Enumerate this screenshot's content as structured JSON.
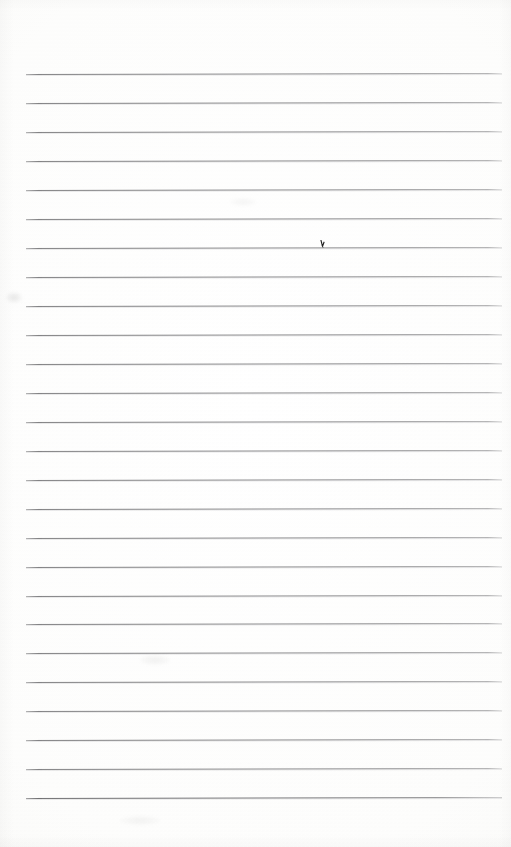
{
  "document": {
    "kind": "scanned-ruled-notebook-page",
    "title": "Blank Ruled Page",
    "orientation": "portrait",
    "page_width_px": 511,
    "page_height_px": 847,
    "body_text": "",
    "has_typed_text": false,
    "has_handwriting": false
  },
  "paper": {
    "background_color": "#ffffff",
    "tone_color": "#fdfdfc",
    "edge_shade_color": "#f5f5f3",
    "texture": "faint-scan-banding"
  },
  "ruling": {
    "line_color": "#86868a",
    "line_color_light": "#a9a9ac",
    "line_color_heavy": "#727275",
    "line_thickness_px": 1,
    "line_count": 26,
    "left_margin_px": 26,
    "right_margin_px": 502,
    "line_length_px": 476,
    "first_line_y_px": 74,
    "last_line_y_px": 798,
    "line_spacing_px": 29,
    "scan_skew_deg": -0.12,
    "top_margin_px": 74,
    "bottom_margin_px": 49,
    "lines": [
      {
        "index": 1,
        "y": 74,
        "weight": "normal"
      },
      {
        "index": 2,
        "y": 103,
        "weight": "normal"
      },
      {
        "index": 3,
        "y": 132,
        "weight": "normal"
      },
      {
        "index": 4,
        "y": 161,
        "weight": "normal"
      },
      {
        "index": 5,
        "y": 190,
        "weight": "normal"
      },
      {
        "index": 6,
        "y": 219,
        "weight": "normal"
      },
      {
        "index": 7,
        "y": 248,
        "weight": "normal"
      },
      {
        "index": 8,
        "y": 277,
        "weight": "normal"
      },
      {
        "index": 9,
        "y": 306,
        "weight": "normal"
      },
      {
        "index": 10,
        "y": 335,
        "weight": "normal"
      },
      {
        "index": 11,
        "y": 364,
        "weight": "normal"
      },
      {
        "index": 12,
        "y": 393,
        "weight": "normal"
      },
      {
        "index": 13,
        "y": 422,
        "weight": "normal"
      },
      {
        "index": 14,
        "y": 451,
        "weight": "normal"
      },
      {
        "index": 15,
        "y": 480,
        "weight": "normal"
      },
      {
        "index": 16,
        "y": 509,
        "weight": "normal"
      },
      {
        "index": 17,
        "y": 538,
        "weight": "normal"
      },
      {
        "index": 18,
        "y": 567,
        "weight": "normal"
      },
      {
        "index": 19,
        "y": 596,
        "weight": "normal"
      },
      {
        "index": 20,
        "y": 624,
        "weight": "normal"
      },
      {
        "index": 21,
        "y": 653,
        "weight": "normal"
      },
      {
        "index": 22,
        "y": 682,
        "weight": "normal"
      },
      {
        "index": 23,
        "y": 711,
        "weight": "normal"
      },
      {
        "index": 24,
        "y": 740,
        "weight": "normal"
      },
      {
        "index": 25,
        "y": 769,
        "weight": "normal"
      },
      {
        "index": 26,
        "y": 798,
        "weight": "heavy"
      }
    ]
  },
  "marks": {
    "pen_tick": {
      "label": "pen-tick-mark",
      "x": 320,
      "y": 240,
      "width": 5,
      "height": 8,
      "color": "#1f1f1f",
      "on_line_index": 7,
      "description": "small dark hooked pen stroke above rule line 7"
    },
    "smudges": [
      {
        "label": "smudge-left-upper",
        "x": 6,
        "y": 292,
        "width": 16,
        "height": 11
      },
      {
        "label": "smudge-top-right",
        "x": 230,
        "y": 198,
        "width": 26,
        "height": 8
      },
      {
        "label": "smudge-center-low",
        "x": 140,
        "y": 655,
        "width": 30,
        "height": 10
      },
      {
        "label": "smudge-bottom-wide",
        "x": 120,
        "y": 816,
        "width": 40,
        "height": 9
      }
    ]
  }
}
